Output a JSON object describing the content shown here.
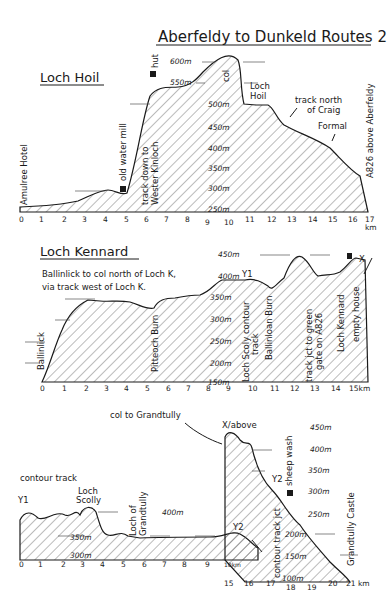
{
  "title": "Aberfeldy to Dunkeld Routes 2",
  "sections": [
    {
      "name": "Loch Hoil",
      "elevations": [
        "600m",
        "550m",
        "500m",
        "450m",
        "400m",
        "350m",
        "300m",
        "250m"
      ],
      "km_ticks": [
        "0",
        "1",
        "2",
        "3",
        "4",
        "5",
        "6",
        "7",
        "8",
        "9",
        "10",
        "11",
        "12",
        "13",
        "14",
        "15",
        "16",
        "17"
      ],
      "km_unit": "km",
      "labels": {
        "start": "Amulree Hotel",
        "mill": "old water mill",
        "hut": "hut",
        "track_down": "track down to",
        "track_down2": "Wester Kinloch",
        "col": "col",
        "loch": "Loch",
        "loch2": "Hoil",
        "track_north1": "track north",
        "track_north2": "of Craig",
        "track_north3": "Formal",
        "end": "A826 above Aberfeldy"
      }
    },
    {
      "name": "Loch Kennard",
      "subtitle1": "Ballinlick to col north of Loch K,",
      "subtitle2": "via track west of Loch K.",
      "elevations": [
        "450m",
        "400m",
        "350m",
        "300m",
        "250m",
        "200m",
        "150m"
      ],
      "km_ticks": [
        "0",
        "1",
        "2",
        "3",
        "4",
        "5",
        "6",
        "7",
        "8",
        "9",
        "10",
        "11",
        "12",
        "13",
        "14",
        "15km"
      ],
      "labels": {
        "start": "Ballinlick",
        "burn1": "Pitteoch Burn",
        "y1": "Y1",
        "scoly1": "Loch Scoly contour",
        "scoly2": "track",
        "burn2": "Ballinloan Burn",
        "jct1": "track jct to green",
        "jct2": "gate on A826",
        "loch": "Loch Kennard",
        "house": "empty house",
        "x": "X"
      }
    },
    {
      "name": "contour track",
      "elevations_left": [
        "400m",
        "350m",
        "300m"
      ],
      "km_ticks_left": [
        "0",
        "1",
        "2",
        "3",
        "4",
        "5",
        "6",
        "7",
        "8",
        "9",
        "10km"
      ],
      "labels": {
        "y1": "Y1",
        "scolly1": "Loch",
        "scolly2": "Scolly",
        "grandtully1": "Loch of",
        "grandtully2": "Grandtully",
        "y2": "Y2"
      }
    },
    {
      "name": "col to Grandtully",
      "elevations": [
        "450m",
        "400m",
        "350m",
        "300m",
        "250m",
        "200m",
        "150m",
        "100m"
      ],
      "km_ticks": [
        "15",
        "16",
        "17",
        "18",
        "19",
        "20",
        "21 km"
      ],
      "labels": {
        "x_above": "X/above",
        "y2": "Y2",
        "sheep": "sheep wash",
        "jct": "contour track jct",
        "end": "Grandtully Castle"
      }
    }
  ]
}
